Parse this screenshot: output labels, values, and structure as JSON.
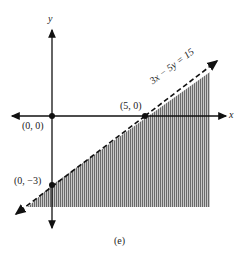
{
  "figure": {
    "caption": "(e)",
    "equation": "3x − 5y = 15",
    "axes": {
      "x_label": "x",
      "y_label": "y"
    },
    "points": [
      {
        "label": "(0, 0)",
        "x": 0,
        "y": 0
      },
      {
        "label": "(5, 0)",
        "x": 5,
        "y": 0
      },
      {
        "label": "(0, −3)",
        "x": 0,
        "y": -3
      }
    ],
    "boundary_style": "dashed",
    "shaded_region": "below line (3x − 5y > 15)",
    "colors": {
      "shade": "#9a9a9a",
      "stroke": "#111111"
    }
  }
}
